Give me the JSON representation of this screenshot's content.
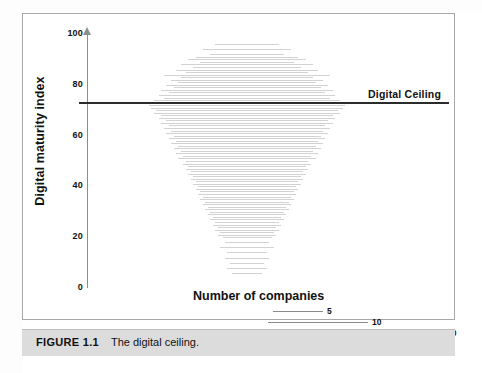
{
  "figure": {
    "caption_label": "FIGURE 1.1",
    "caption_text": "The digital ceiling."
  },
  "annotations": {
    "ceiling_label": "Digital Ceiling"
  },
  "colors": {
    "bar": "#d2d2d2",
    "ceiling_line": "#2b2b2b",
    "axis": "#8d8d8d",
    "frame": "#a8a8a8",
    "caption_band": "#dcdcdc",
    "text": "#111111"
  },
  "legend": {
    "title": "Number of companies",
    "entries": [
      {
        "value": "5",
        "count": 5,
        "length_px": 50
      },
      {
        "value": "10",
        "count": 10,
        "length_px": 100
      },
      {
        "value": "20",
        "count": 20,
        "length_px": 196
      }
    ]
  },
  "chart_data": {
    "type": "bar",
    "orientation": "horizontal-centered",
    "title": "The digital ceiling.",
    "xlabel": "Number of companies",
    "ylabel": "Digital maturity index",
    "ylim": [
      0,
      100
    ],
    "xlim": [
      0,
      20
    ],
    "yticks": [
      0,
      20,
      40,
      60,
      80,
      100
    ],
    "ytick_labels": [
      "0",
      "20",
      "40",
      "60",
      "80",
      "100"
    ],
    "grid": false,
    "legend_position": "bottom",
    "reference_lines": [
      {
        "name": "Digital Ceiling",
        "axis": "y",
        "value": 72,
        "color": "#2b2b2b"
      }
    ],
    "note": "Each light-grey horizontal bar is a histogram row: bar length = number of companies at that digital maturity index value. Bars are centred on the plot.",
    "categories": [
      96,
      94,
      92,
      91,
      90,
      89,
      88,
      87,
      86,
      85,
      84,
      83,
      82,
      81,
      80,
      79,
      78,
      77,
      76,
      75,
      74,
      73,
      72,
      71,
      70,
      69,
      68,
      67,
      66,
      65,
      64,
      63,
      62,
      61,
      60,
      59,
      58,
      57,
      56,
      55,
      54,
      53,
      52,
      51,
      50,
      49,
      48,
      47,
      46,
      45,
      44,
      43,
      42,
      41,
      40,
      39,
      38,
      37,
      36,
      35,
      34,
      33,
      32,
      31,
      30,
      29,
      28,
      27,
      26,
      25,
      24,
      23,
      22,
      21,
      20,
      18,
      16,
      14,
      12,
      10,
      8,
      6
    ],
    "values": [
      6.5,
      9.0,
      7.5,
      10.5,
      12.0,
      9.5,
      13.5,
      11.0,
      14.5,
      12.5,
      17.0,
      13.5,
      15.5,
      14.0,
      16.5,
      15.0,
      17.5,
      16.0,
      18.0,
      17.0,
      19.0,
      18.5,
      20.0,
      19.5,
      18.5,
      19.0,
      17.5,
      18.0,
      16.5,
      17.5,
      16.0,
      17.0,
      15.5,
      16.5,
      15.0,
      16.0,
      14.5,
      15.5,
      14.0,
      15.0,
      13.5,
      14.5,
      13.0,
      14.0,
      12.5,
      13.0,
      12.0,
      12.5,
      11.5,
      12.0,
      11.0,
      11.5,
      10.5,
      11.0,
      10.0,
      10.5,
      9.5,
      10.0,
      9.0,
      9.5,
      8.5,
      9.0,
      8.0,
      8.5,
      7.5,
      8.0,
      7.0,
      7.5,
      6.5,
      7.0,
      6.0,
      6.5,
      5.5,
      6.0,
      5.0,
      4.5,
      5.5,
      4.0,
      4.5,
      3.5,
      4.0,
      3.0
    ]
  }
}
